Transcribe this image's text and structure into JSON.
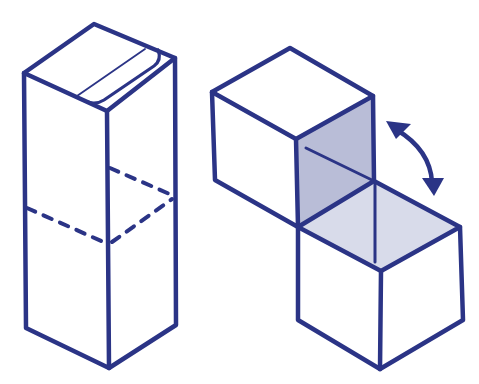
{
  "diagram": {
    "title": "",
    "colors": {
      "line": "#2b3486",
      "shade_dark": "#b9bdd7",
      "shade_light": "#d8dbea",
      "background": "#ffffff"
    },
    "figures": [
      {
        "id": "tall-box",
        "label": "",
        "features": [
          "top stripe with rounded end",
          "dashed fold line around middle"
        ]
      },
      {
        "id": "hinged-cubes",
        "label": "",
        "features": [
          "upper cube",
          "lower cube",
          "shaded inner faces",
          "double-headed curved arrow"
        ]
      }
    ],
    "arrow": {
      "type": "double-headed curved",
      "direction": "rotate"
    }
  }
}
